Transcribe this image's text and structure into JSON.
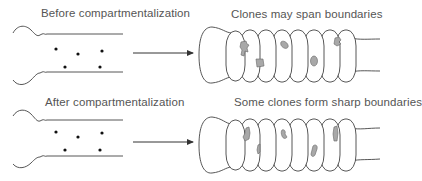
{
  "panels": {
    "top_left": {
      "label": "Before compartmentalization",
      "dots": [
        [
          56,
          50
        ],
        [
          78,
          54
        ],
        [
          102,
          51
        ],
        [
          65,
          67
        ],
        [
          100,
          67
        ]
      ]
    },
    "top_right": {
      "label": "Clones may span boundaries"
    },
    "bottom_left": {
      "label": "After compartmentalization",
      "dots": [
        [
          56,
          132
        ],
        [
          78,
          137
        ],
        [
          102,
          133
        ],
        [
          65,
          150
        ],
        [
          100,
          150
        ]
      ]
    },
    "bottom_right": {
      "label": "Some clones form sharp boundaries"
    }
  },
  "icons": {
    "arrow": "right-arrow",
    "dot": "cell-dot",
    "clone": "clone-patch"
  },
  "colors": {
    "line": "#444444",
    "clone_fill": "#a8a8a8",
    "text": "#555555"
  }
}
